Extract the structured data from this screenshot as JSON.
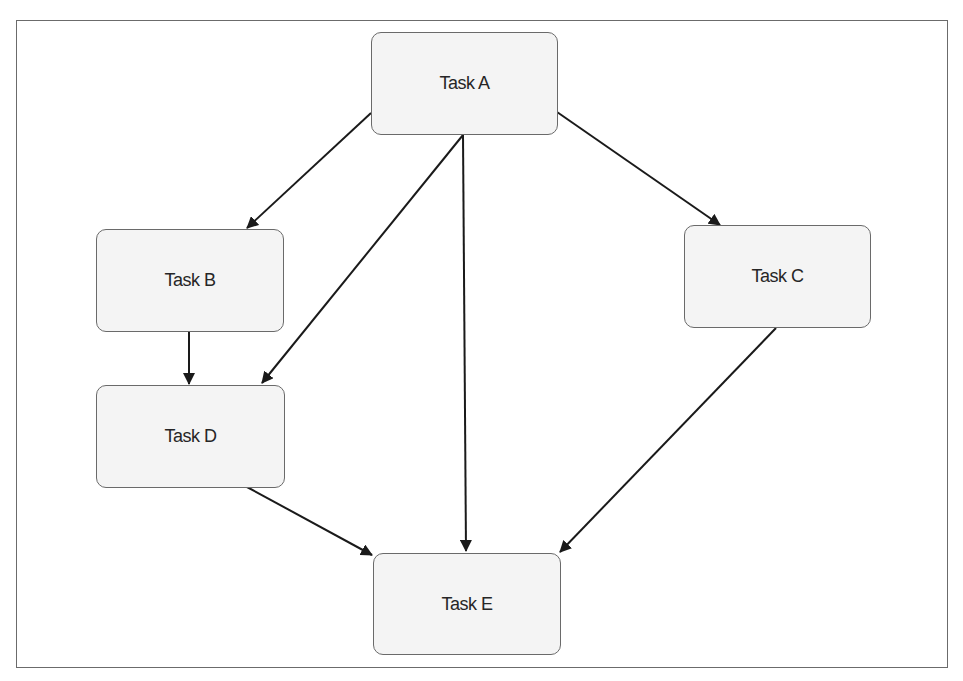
{
  "diagram": {
    "type": "directed-acyclic-graph",
    "nodes": [
      {
        "id": "A",
        "label": "Task A"
      },
      {
        "id": "B",
        "label": "Task B"
      },
      {
        "id": "C",
        "label": "Task C"
      },
      {
        "id": "D",
        "label": "Task D"
      },
      {
        "id": "E",
        "label": "Task E"
      }
    ],
    "edges": [
      {
        "from": "A",
        "to": "B"
      },
      {
        "from": "A",
        "to": "C"
      },
      {
        "from": "A",
        "to": "D"
      },
      {
        "from": "A",
        "to": "E"
      },
      {
        "from": "B",
        "to": "D"
      },
      {
        "from": "C",
        "to": "E"
      },
      {
        "from": "D",
        "to": "E"
      }
    ]
  },
  "colors": {
    "node_fill": "#f4f4f4",
    "node_border": "#6a6a6a",
    "edge": "#1a1a1a",
    "frame_border": "#6b6b6b"
  }
}
